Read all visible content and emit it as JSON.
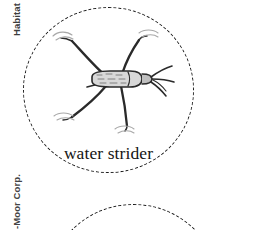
{
  "page": {
    "width": 261,
    "height": 230,
    "background_color": "#ffffff",
    "ink_color": "#1a1a1a"
  },
  "margin_labels": {
    "section_label": "Habitat",
    "copyright_label": "-Moor Corp."
  },
  "habitat_panels": [
    {
      "name": "water-strider-panel",
      "caption": "water strider",
      "border_style": "dashed",
      "border_color": "#1a1a1a",
      "illustration": "water-strider-insect"
    },
    {
      "name": "second-habitat-panel",
      "caption": "",
      "border_style": "dashed",
      "border_color": "#1a1a1a",
      "illustration": ""
    }
  ],
  "illustration": {
    "subject": "water strider",
    "line_color": "#2a2a2a",
    "body_fill": "#d8d8d8",
    "ripple_color": "#9a9a9a",
    "parts": [
      "body",
      "head",
      "antennae",
      "front-leg-left",
      "front-leg-right",
      "hind-leg-left",
      "hind-leg-right",
      "water-ripples"
    ]
  }
}
